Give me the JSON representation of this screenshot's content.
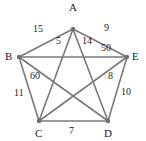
{
  "figure": {
    "type": "weighted-complete-graph",
    "name": "K5 weighted graph",
    "background_color": "#ffffff",
    "edge_color": "#7a7a7a",
    "node_color": "#6e6e6e",
    "text_color": "#1c1c1c"
  },
  "chart_data": {
    "type": "diagram",
    "title": "",
    "graph_type": "complete graph K5",
    "nodes": [
      {
        "id": "A",
        "label": "A",
        "x": 73,
        "y": 29,
        "label_x": 69,
        "label_y": 2
      },
      {
        "id": "B",
        "label": "B",
        "x": 19,
        "y": 57,
        "label_x": 5,
        "label_y": 51
      },
      {
        "id": "C",
        "label": "C",
        "x": 39,
        "y": 121,
        "label_x": 35,
        "label_y": 128
      },
      {
        "id": "D",
        "label": "D",
        "x": 108,
        "y": 121,
        "label_x": 104,
        "label_y": 128
      },
      {
        "id": "E",
        "label": "E",
        "x": 127,
        "y": 57,
        "label_x": 132,
        "label_y": 51
      }
    ],
    "edges": [
      {
        "from": "A",
        "to": "B",
        "weight": 15,
        "kind": "outer",
        "label_x": 33,
        "label_y": 24
      },
      {
        "from": "A",
        "to": "E",
        "weight": 9,
        "kind": "outer",
        "label_x": 104,
        "label_y": 23
      },
      {
        "from": "B",
        "to": "C",
        "weight": 11,
        "kind": "outer",
        "label_x": 14,
        "label_y": 88
      },
      {
        "from": "C",
        "to": "D",
        "weight": 7,
        "kind": "outer",
        "label_x": 69,
        "label_y": 126
      },
      {
        "from": "D",
        "to": "E",
        "weight": 10,
        "kind": "outer",
        "label_x": 121,
        "label_y": 87
      },
      {
        "from": "A",
        "to": "C",
        "weight": 5,
        "kind": "diagonal",
        "label_x": 56,
        "label_y": 36
      },
      {
        "from": "A",
        "to": "D",
        "weight": 14,
        "kind": "diagonal",
        "label_x": 82,
        "label_y": 36
      },
      {
        "from": "B",
        "to": "E",
        "weight": 50,
        "kind": "diagonal",
        "label_x": 101,
        "label_y": 43
      },
      {
        "from": "B",
        "to": "D",
        "weight": 60,
        "kind": "diagonal",
        "label_x": 30,
        "label_y": 71
      },
      {
        "from": "C",
        "to": "E",
        "weight": 8,
        "kind": "diagonal",
        "label_x": 108,
        "label_y": 71
      }
    ],
    "node_labels": [
      "A",
      "B",
      "C",
      "D",
      "E"
    ],
    "weight_labels": [
      "15",
      "9",
      "11",
      "7",
      "10",
      "5",
      "14",
      "50",
      "60",
      "8"
    ]
  }
}
